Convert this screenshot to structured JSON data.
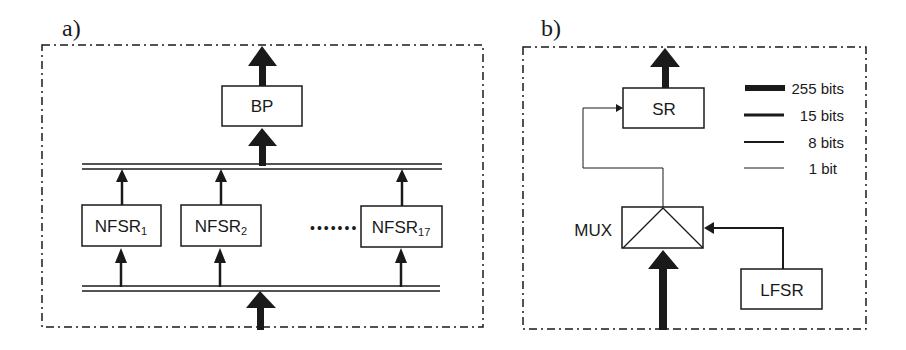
{
  "panel_a": {
    "label": "a)",
    "blocks": {
      "bp": "BP",
      "nfsr1": "NFSR",
      "nfsr1_sub": "1",
      "nfsr2": "NFSR",
      "nfsr2_sub": "2",
      "nfsr17": "NFSR",
      "nfsr17_sub": "17"
    },
    "ellipsis": "•••••••"
  },
  "panel_b": {
    "label": "b)",
    "blocks": {
      "sr": "SR",
      "mux": "MUX",
      "lfsr": "LFSR"
    },
    "legend": [
      {
        "label": "255 bits",
        "width": 7
      },
      {
        "label": "15 bits",
        "width": 3
      },
      {
        "label": "8 bits",
        "width": 2
      },
      {
        "label": "1 bit",
        "width": 1
      }
    ]
  },
  "colors": {
    "stroke": "#1a1a1a",
    "background": "#ffffff"
  }
}
